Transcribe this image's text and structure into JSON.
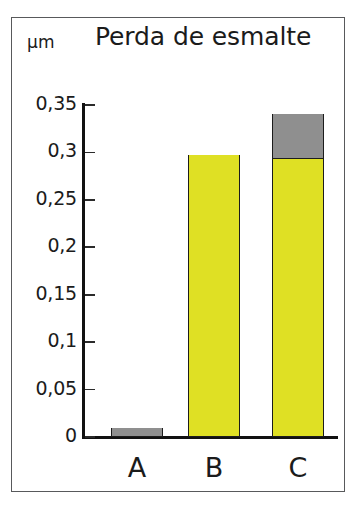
{
  "figure": {
    "title": "Perda de esmalte",
    "unit_label": "µm",
    "frame_color": "#58595b"
  },
  "colors": {
    "yellow": "#dfe024",
    "gray": "#8f8f8f",
    "axis": "#111111",
    "outline": "#1c1c1c"
  },
  "chart_data": {
    "type": "bar",
    "title": "Perda de esmalte",
    "xlabel": "",
    "ylabel": "µm",
    "ylim": [
      0,
      0.35
    ],
    "grid": false,
    "legend": "none",
    "stacked": true,
    "categories": [
      "A",
      "B",
      "C"
    ],
    "ytick_labels": [
      "0,35",
      "0,3",
      "0,25",
      "0,2",
      "0,15",
      "0,1",
      "0,05",
      "0"
    ],
    "ytick_values": [
      0.35,
      0.3,
      0.25,
      0.2,
      0.15,
      0.1,
      0.05,
      0
    ],
    "series": [
      {
        "name": "yellow",
        "color": "#dfe024",
        "values": [
          0,
          0.297,
          0.294
        ]
      },
      {
        "name": "gray",
        "color": "#8f8f8f",
        "values": [
          0.009,
          0,
          0.046
        ]
      }
    ],
    "totals": [
      0.009,
      0.297,
      0.34
    ]
  },
  "yticks": [
    {
      "label": "0,35",
      "value": 0.35
    },
    {
      "label": "0,3",
      "value": 0.3
    },
    {
      "label": "0,25",
      "value": 0.25
    },
    {
      "label": "0,2",
      "value": 0.2
    },
    {
      "label": "0,15",
      "value": 0.15
    },
    {
      "label": "0,1",
      "value": 0.1
    },
    {
      "label": "0,05",
      "value": 0.05
    },
    {
      "label": "0",
      "value": 0
    }
  ],
  "bars": [
    {
      "category": "A",
      "x": 111,
      "width": 52,
      "segments": [
        {
          "name": "gray",
          "from": 0,
          "to": 0.009,
          "color": "#8f8f8f"
        }
      ]
    },
    {
      "category": "B",
      "x": 188,
      "width": 52,
      "segments": [
        {
          "name": "yellow",
          "from": 0,
          "to": 0.297,
          "color": "#dfe024"
        }
      ]
    },
    {
      "category": "C",
      "x": 272,
      "width": 52,
      "segments": [
        {
          "name": "yellow",
          "from": 0,
          "to": 0.294,
          "color": "#dfe024"
        },
        {
          "name": "gray",
          "from": 0.294,
          "to": 0.34,
          "color": "#8f8f8f"
        }
      ]
    }
  ]
}
